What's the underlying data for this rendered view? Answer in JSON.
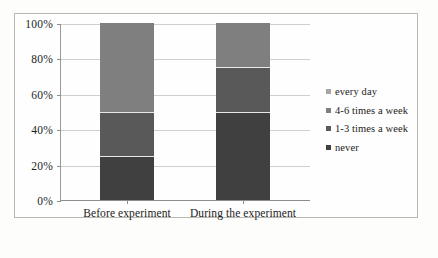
{
  "chart_data": {
    "type": "bar",
    "subtype": "stacked-100-percent",
    "title": "",
    "xlabel": "",
    "ylabel": "",
    "categories": [
      "Before experiment",
      "During the experiment"
    ],
    "ylim": [
      0,
      100
    ],
    "ytick_labels": [
      "0%",
      "20%",
      "40%",
      "60%",
      "80%",
      "100%"
    ],
    "ytick_values": [
      0,
      20,
      40,
      60,
      80,
      100
    ],
    "grid": true,
    "legend_position": "right",
    "series": [
      {
        "name": "never",
        "values": [
          25,
          50
        ],
        "color": "#404040"
      },
      {
        "name": "1-3 times a week",
        "values": [
          25,
          25
        ],
        "color": "#595959"
      },
      {
        "name": "4-6 times a week",
        "values": [
          50,
          25
        ],
        "color": "#7f7f7f"
      },
      {
        "name": "every day",
        "values": [
          0,
          0
        ],
        "color": "#a6a6a6"
      }
    ],
    "legend_order": [
      "every day",
      "4-6 times a week",
      "1-3 times a week",
      "never"
    ]
  },
  "legend": {
    "items": [
      {
        "label": "every day",
        "color": "#a6a6a6"
      },
      {
        "label": "4-6 times a week",
        "color": "#7f7f7f"
      },
      {
        "label": "1-3 times a week",
        "color": "#595959"
      },
      {
        "label": "never",
        "color": "#404040"
      }
    ]
  },
  "axis": {
    "y_ticks": [
      {
        "label": "100%",
        "value": 100
      },
      {
        "label": "80%",
        "value": 80
      },
      {
        "label": "60%",
        "value": 60
      },
      {
        "label": "40%",
        "value": 40
      },
      {
        "label": "20%",
        "value": 20
      },
      {
        "label": "0%",
        "value": 0
      }
    ],
    "x_ticks": [
      {
        "label": "Before experiment"
      },
      {
        "label": "During the experiment"
      }
    ]
  }
}
